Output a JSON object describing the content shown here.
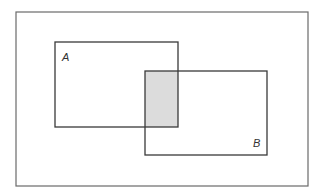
{
  "diagram": {
    "type": "venn-rectangles",
    "universe": {
      "x": 16,
      "y": 12,
      "w": 292,
      "h": 174
    },
    "sets": [
      {
        "label": "A",
        "x": 55,
        "y": 42,
        "w": 123,
        "h": 85,
        "label_x": 62,
        "label_y": 61
      },
      {
        "label": "B",
        "x": 145,
        "y": 71,
        "w": 122,
        "h": 84,
        "label_x": 253,
        "label_y": 147
      }
    ],
    "intersection": {
      "label": "A ∩ B",
      "x": 145,
      "y": 71,
      "w": 33,
      "h": 56,
      "fill": "#dcdcdc"
    },
    "stroke_color": "#3a3a3a",
    "universe_stroke_color": "#6a6a6a"
  }
}
